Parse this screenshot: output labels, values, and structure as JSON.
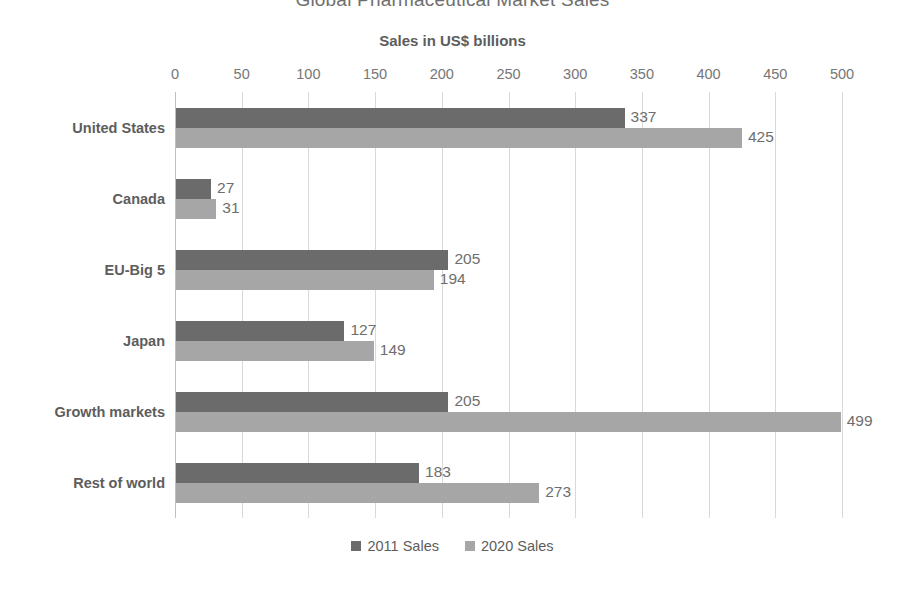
{
  "chart_data": {
    "type": "bar",
    "orientation": "horizontal",
    "title": "Global Pharmaceutical Market Sales",
    "xlabel": "Sales in US$ billions",
    "ylabel": "",
    "xlim": [
      0,
      500
    ],
    "xticks": [
      0,
      50,
      100,
      150,
      200,
      250,
      300,
      350,
      400,
      450,
      500
    ],
    "xtick_labels": [
      "0",
      "50",
      "100",
      "150",
      "200",
      "250",
      "300",
      "350",
      "400",
      "450",
      "500"
    ],
    "grid": "vertical",
    "legend_position": "bottom",
    "categories": [
      "United States",
      "Canada",
      "EU-Big 5",
      "Japan",
      "Growth markets",
      "Rest of world"
    ],
    "series": [
      {
        "name": "2011 Sales",
        "color": "#6b6b6b",
        "values": [
          337,
          27,
          205,
          127,
          205,
          183
        ],
        "labels": [
          "337",
          "27",
          "205",
          "127",
          "205",
          "183"
        ]
      },
      {
        "name": "2020 Sales",
        "color": "#a6a6a6",
        "values": [
          425,
          31,
          194,
          149,
          499,
          273
        ],
        "labels": [
          "425",
          "31",
          "194",
          "149",
          "499",
          "273"
        ]
      }
    ]
  },
  "colors": {
    "background": "#ffffff",
    "gridline": "#d9d9d9",
    "axis_line": "#bfbfbf",
    "title_text": "#6f6f6f",
    "label_text": "#5d5d5d",
    "tick_text": "#767676",
    "data_label_text": "#6e6e6e"
  }
}
